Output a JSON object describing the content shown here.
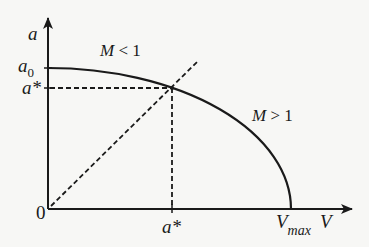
{
  "diagram": {
    "type": "phase-plot",
    "axes": {
      "y_label": "a",
      "x_label": "V",
      "origin_label": "0"
    },
    "y_ticks": {
      "a0": {
        "main": "a",
        "sub": "0"
      },
      "a_star": "a*"
    },
    "x_ticks": {
      "a_star": "a*",
      "v_max": {
        "main": "V",
        "sub": "max"
      }
    },
    "regions": {
      "subsonic": {
        "main": "M",
        "op": "< 1"
      },
      "supersonic": {
        "main": "M",
        "op": "> 1"
      }
    },
    "curves": [
      {
        "name": "ellipse-a-vs-V",
        "style": "solid",
        "from": "a0 at V=0",
        "to": "V=Vmax at a=0"
      },
      {
        "name": "sonic-line-a-equals-V",
        "style": "dashed",
        "from": "origin"
      },
      {
        "name": "a-star-horizontal-guide",
        "style": "dashed"
      },
      {
        "name": "a-star-vertical-guide",
        "style": "dashed"
      }
    ],
    "colors": {
      "ink": "#1a1a1a",
      "background": "#f7f7f5"
    }
  }
}
